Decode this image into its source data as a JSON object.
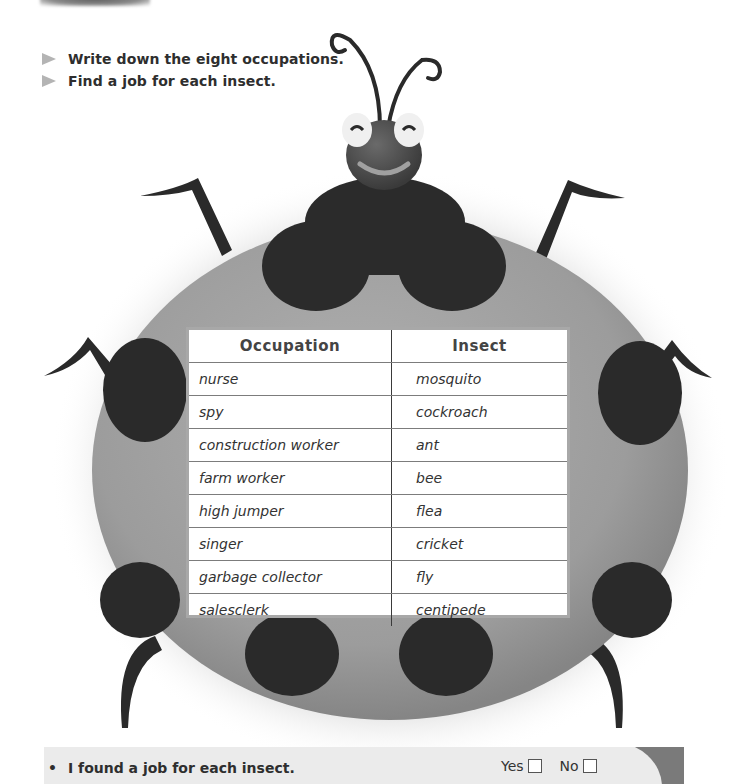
{
  "instructions": [
    {
      "icon": "arrow-right-icon",
      "text": "Write down the eight occupations."
    },
    {
      "icon": "arrow-right-icon",
      "text": "Find a job for each insect."
    }
  ],
  "table": {
    "headers": [
      "Occupation",
      "Insect"
    ],
    "rows": [
      [
        "nurse",
        "mosquito"
      ],
      [
        "spy",
        "cockroach"
      ],
      [
        "construction worker",
        "ant"
      ],
      [
        "farm worker",
        "bee"
      ],
      [
        "high jumper",
        "flea"
      ],
      [
        "singer",
        "cricket"
      ],
      [
        "garbage collector",
        "fly"
      ],
      [
        "salesclerk",
        "centipede"
      ]
    ]
  },
  "footer": {
    "bullet": "•",
    "statement": "I found a job for each insect.",
    "yes_label": "Yes",
    "no_label": "No"
  },
  "colors": {
    "shell": "#9a9a9a",
    "spots": "#2a2a2a",
    "table_border": "#a8a8a8",
    "footer_bg": "#ebebeb",
    "footer_accent": "#7a7a7a"
  }
}
